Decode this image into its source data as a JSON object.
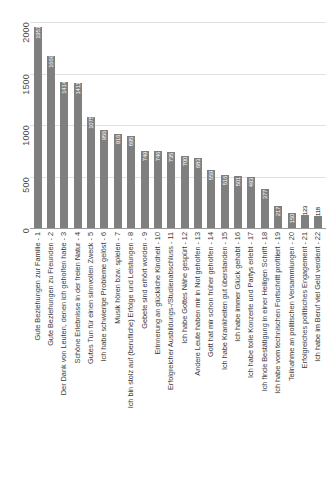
{
  "chart_data": {
    "type": "bar",
    "title": "",
    "subtitle": "",
    "xlabel": "",
    "ylabel": "",
    "ylim": [
      0,
      2000
    ],
    "yticks": [
      "0",
      "500",
      "1000",
      "1500",
      "2000"
    ],
    "grid": true,
    "legend": null,
    "orientation": "vertical",
    "bar_color": "#7f7f7f",
    "label_color_inside": "#ffffff",
    "label_color_outside": "#000000",
    "gridline_color": "#e2e2e2",
    "axis_color": "#9a9a9a",
    "categories": [
      "Gute Beziehungen zur Familie - 1",
      "Gute Beziehungen zu Freunden - 2",
      "Der Dank von Leuten, denen ich geholfen habe - 3",
      "Schöne Erlebnisse in der freien Natur - 4",
      "Gutes Tun für einen sinnvollen Zweck - 5",
      "Ich habe schwierige Probleme gelöst - 6",
      "Musik hören bzw. spielen - 7",
      "Ich bin stolz auf (berufliche) Erfolge und Leistungen - 8",
      "Gebete sind erhört worden - 9",
      "Erinnerung an glückliche Kindheit - 10",
      "Erfolgreicher Ausbildungs-/Studienabschluss - 11",
      "Ich habe Gottes Nähe gespürt - 12",
      "Andere Leute haben mir in Not geholfen - 13",
      "Gott hat mir schon früher geholfen - 14",
      "Ich habe Krankheiten gut überstanden - 15",
      "Ich habe immer Glück gehabt - 16",
      "Ich habe tolle Konzerte und Partys erlebt - 17",
      "Ich finde Bestätigung in einer Heiligen Schrift - 18",
      "Ich habe vom technischen Fortschritt profitiert - 19",
      "Teilnahme an politischen Versammlungen - 20",
      "Erfolgreiches politisches Engagement - 21",
      "Ich habe im Beruf viel Geld verdient - 22"
    ],
    "values": [
      1951,
      1669,
      1414,
      1411,
      1075,
      956,
      916,
      895,
      749,
      746,
      735,
      700,
      683,
      559,
      516,
      501,
      493,
      377,
      217,
      150,
      123,
      118
    ],
    "value_labels": [
      "1951",
      "1669",
      "1414",
      "1411",
      "1075",
      "956",
      "916",
      "895",
      "749",
      "746",
      "735",
      "700",
      "683",
      "559",
      "516",
      "501",
      "493",
      "377",
      "217",
      "150",
      "123",
      "118"
    ],
    "label_placement": [
      "inside",
      "inside",
      "inside",
      "inside",
      "inside",
      "inside",
      "inside",
      "inside",
      "inside",
      "inside",
      "inside",
      "inside",
      "inside",
      "inside",
      "inside",
      "inside",
      "inside",
      "inside",
      "inside",
      "inside",
      "outside",
      "outside"
    ]
  }
}
